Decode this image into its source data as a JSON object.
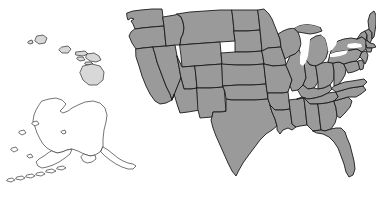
{
  "map": {
    "title": "United States Map",
    "type": "choropleth-outline",
    "projection": "albers-usa",
    "background_color": "#ffffff",
    "land_fill_color": "#9a9a9a",
    "border_color": "#1a1a1a",
    "outline_fill_color": "#ffffff",
    "island_fill_color": "#d8d8d8",
    "lake_fill_color": "#ffffff",
    "regions": {
      "contiguous": {
        "name": "Contiguous United States",
        "fill": "#9a9a9a",
        "stroke": "#1a1a1a",
        "state_borders_visible": true
      },
      "alaska": {
        "name": "Alaska",
        "fill": "#ffffff",
        "stroke": "#3a3a3a",
        "position": "lower-left",
        "includes_aleutians": true
      },
      "hawaii": {
        "name": "Hawaii",
        "fill": "#d8d8d8",
        "stroke": "#2a2a2a",
        "position": "upper-left",
        "island_count": 8
      }
    },
    "water_bodies": [
      {
        "name": "Lake Michigan",
        "fill": "#ffffff"
      },
      {
        "name": "Lake Superior",
        "fill": "#ffffff"
      },
      {
        "name": "Lake Huron",
        "fill": "#ffffff"
      },
      {
        "name": "Lake Erie",
        "fill": "#ffffff"
      },
      {
        "name": "Lake Ontario",
        "fill": "#ffffff"
      }
    ],
    "states_shown": [
      "Washington",
      "Oregon",
      "California",
      "Nevada",
      "Idaho",
      "Montana",
      "Wyoming",
      "Utah",
      "Arizona",
      "Colorado",
      "New Mexico",
      "North Dakota",
      "South Dakota",
      "Nebraska",
      "Kansas",
      "Oklahoma",
      "Texas",
      "Minnesota",
      "Iowa",
      "Missouri",
      "Arkansas",
      "Louisiana",
      "Wisconsin",
      "Illinois",
      "Mississippi",
      "Michigan",
      "Indiana",
      "Ohio",
      "Kentucky",
      "Tennessee",
      "Alabama",
      "Georgia",
      "Florida",
      "South Carolina",
      "North Carolina",
      "Virginia",
      "West Virginia",
      "Maryland",
      "Delaware",
      "Pennsylvania",
      "New Jersey",
      "New York",
      "Connecticut",
      "Rhode Island",
      "Massachusetts",
      "Vermont",
      "New Hampshire",
      "Maine",
      "Alaska",
      "Hawaii"
    ],
    "labels_visible": false,
    "legend_visible": false
  }
}
